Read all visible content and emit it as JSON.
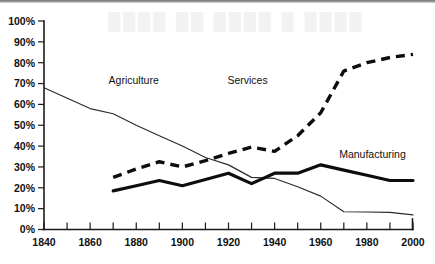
{
  "chart_data": {
    "type": "line",
    "title": "",
    "xlabel": "",
    "ylabel": "",
    "xlim": [
      1840,
      2000
    ],
    "ylim": [
      0,
      100
    ],
    "grid": false,
    "legend_position": "inline-labels",
    "x_tick_labels": [
      "1840",
      "1860",
      "1880",
      "1900",
      "1920",
      "1940",
      "1960",
      "1980",
      "2000"
    ],
    "x_tick_values": [
      1840,
      1860,
      1880,
      1900,
      1920,
      1940,
      1960,
      1980,
      2000
    ],
    "x_minor_ticks": [
      1850,
      1870,
      1890,
      1910,
      1930,
      1950,
      1970,
      1990
    ],
    "y_tick_labels": [
      "0%",
      "10%",
      "20%",
      "30%",
      "40%",
      "50%",
      "60%",
      "70%",
      "80%",
      "90%",
      "100%"
    ],
    "y_tick_values": [
      0,
      10,
      20,
      30,
      40,
      50,
      60,
      70,
      80,
      90,
      100
    ],
    "series": [
      {
        "name": "Agriculture",
        "style": "thin-solid",
        "color": "#2b2b2b",
        "label_x": 1868,
        "label_y": 70,
        "x": [
          1840,
          1860,
          1870,
          1880,
          1890,
          1900,
          1910,
          1920,
          1930,
          1940,
          1950,
          1960,
          1970,
          1980,
          1990,
          2000
        ],
        "values": [
          68,
          58,
          55.5,
          50,
          45,
          40,
          34.5,
          31,
          25,
          24.5,
          20.5,
          16,
          8.5,
          8.4,
          8.2,
          7
        ]
      },
      {
        "name": "Manufacturing",
        "style": "thick-solid",
        "color": "#0d0d0d",
        "label_x": 1968,
        "label_y": 34.5,
        "x": [
          1870,
          1880,
          1890,
          1900,
          1910,
          1920,
          1930,
          1940,
          1950,
          1960,
          1970,
          1980,
          1990,
          2000
        ],
        "values": [
          18.5,
          21,
          23.5,
          21,
          24,
          27,
          22,
          27,
          27,
          31,
          28.5,
          26,
          23.5,
          23.5
        ]
      },
      {
        "name": "Services",
        "style": "thick-dashed",
        "color": "#0d0d0d",
        "label_x": 1937,
        "label_y": 70,
        "x": [
          1870,
          1880,
          1890,
          1900,
          1910,
          1920,
          1930,
          1940,
          1950,
          1960,
          1970,
          1980,
          1990,
          2000
        ],
        "values": [
          25,
          29,
          32.5,
          30,
          33,
          36.5,
          39.5,
          37.5,
          45,
          56,
          76,
          80,
          82.5,
          84
        ]
      }
    ]
  },
  "artifacts": {
    "ghost_text": "████  ██ ████   █ ████"
  }
}
